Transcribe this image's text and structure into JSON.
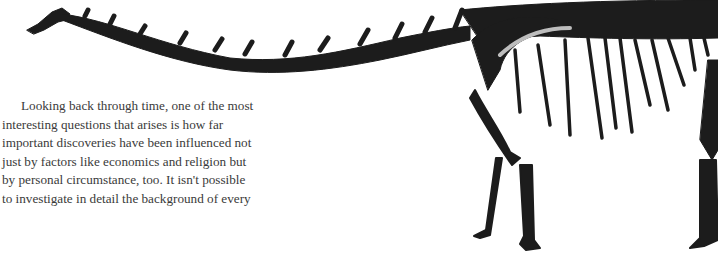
{
  "illustration": {
    "subject": "dinosaur-skeleton",
    "color": "#1a1a1a"
  },
  "paragraph": {
    "lines": [
      "Looking back through time, one of the most",
      "interesting questions that arises is how far",
      "important discoveries have been influenced not",
      "just by factors like economics and religion but",
      "by personal circumstance, too. It isn't possible",
      "to investigate in detail the background of every"
    ]
  }
}
